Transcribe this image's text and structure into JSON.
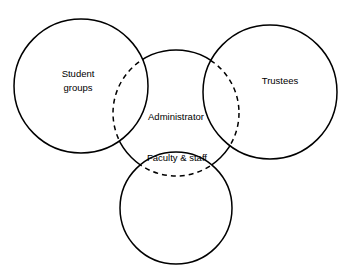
{
  "diagram": {
    "type": "venn-overlap-diagram",
    "background_color": "#ffffff",
    "stroke_color": "#000000",
    "canvas": {
      "width": 352,
      "height": 278
    },
    "top_caption": "",
    "circles": [
      {
        "id": "student-groups",
        "label": "Student",
        "label_line2": "groups",
        "cx": 81,
        "cy": 86,
        "r": 67,
        "stroke": "#000000",
        "stroke_width": 1.5,
        "style": "solid",
        "label_x": 78,
        "label_y": 79
      },
      {
        "id": "trustees",
        "label": "Trustees",
        "label_line2": "",
        "cx": 270,
        "cy": 92,
        "r": 67,
        "stroke": "#000000",
        "stroke_width": 1.5,
        "style": "solid",
        "label_x": 280,
        "label_y": 81
      },
      {
        "id": "faculty-staff",
        "label": "Faculty & staff",
        "label_line2": "",
        "cx": 176,
        "cy": 208,
        "r": 56,
        "stroke": "#000000",
        "stroke_width": 1.5,
        "style": "solid",
        "label_x": 177,
        "label_y": 158
      },
      {
        "id": "administrator",
        "label": "Administrator",
        "label_line2": "",
        "cx": 176,
        "cy": 113,
        "r": 63,
        "stroke": "#000000",
        "stroke_width": 1.5,
        "style": "mixed-solid-dashed",
        "dash_pattern": "5,4",
        "label_x": 176,
        "label_y": 117
      }
    ]
  }
}
